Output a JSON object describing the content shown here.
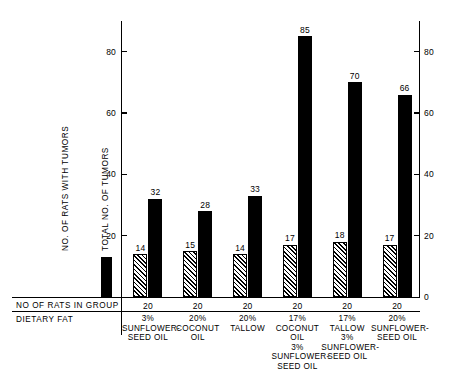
{
  "chart_data": {
    "type": "bar",
    "title": "",
    "xlabel": "DIETARY FAT",
    "ylabel": "",
    "ylim": [
      0,
      90
    ],
    "grid": false,
    "legend_position": "left-inset",
    "categories": [
      "3% SUNFLOWER-SEED OIL",
      "20% COCONUT OIL",
      "20% TALLOW",
      "17% COCONUT OIL 3% SUNFLOWER-SEED OIL",
      "17% TALLOW 3% SUNFLOWER-SEED OIL",
      "20% SUNFLOWER-SEED OIL"
    ],
    "series": [
      {
        "name": "NO. OF RATS WITH TUMORS",
        "style": "hatched",
        "values": [
          14,
          15,
          14,
          17,
          18,
          17
        ]
      },
      {
        "name": "TOTAL NO. OF TUMORS",
        "style": "solid",
        "values": [
          32,
          28,
          33,
          85,
          70,
          66
        ]
      }
    ],
    "axis_left": {
      "ticks": [
        20,
        40,
        60,
        80
      ],
      "tick_labels": [
        "20",
        "40",
        "60",
        "80"
      ]
    },
    "axis_right": {
      "ticks": [
        0,
        20,
        40,
        60,
        80
      ],
      "tick_labels": [
        "0",
        "20",
        "40",
        "60",
        "80"
      ]
    }
  },
  "legend": {
    "entries": [
      {
        "label": "NO. OF RATS WITH TUMORS",
        "style": "hatched"
      },
      {
        "label": "TOTAL  NO. OF TUMORS",
        "style": "solid"
      }
    ]
  },
  "table": {
    "rows": [
      {
        "label": "NO OF RATS IN GROUP"
      },
      {
        "label": "DIETARY FAT"
      }
    ],
    "group_counts": [
      "20",
      "20",
      "20",
      "20",
      "20",
      "20"
    ],
    "group_fats": [
      [
        "3%",
        "SUNFLOWER-",
        "SEED OIL"
      ],
      [
        "20%",
        "COCONUT",
        "OIL"
      ],
      [
        "20%",
        "TALLOW"
      ],
      [
        "17%",
        "COCONUT",
        "OIL",
        "3%",
        "SUNFLOWER-",
        "SEED OIL"
      ],
      [
        "17%",
        "TALLOW",
        "3%",
        "SUNFLOWER-",
        "SEED OIL"
      ],
      [
        "20%",
        "SUNFLOWER-",
        "SEED OIL"
      ]
    ]
  }
}
